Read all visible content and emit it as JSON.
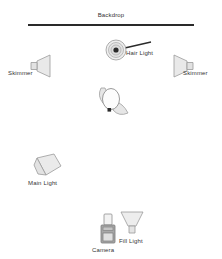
{
  "diagram": {
    "background_color": "#ffffff",
    "stroke_color": "#9a9a9a",
    "fill_color": "#e8e8e8",
    "label_color": "#333333",
    "backdrop": {
      "label": "Backdrop",
      "color": "#2a2a2a",
      "x": 28,
      "y": 24,
      "width": 166
    },
    "elements": [
      {
        "id": "hair-light",
        "label": "Hair Light",
        "icon": "umbrella-top-view-icon",
        "x": 105,
        "y": 39
      },
      {
        "id": "skimmer-left",
        "label": "Skimmer",
        "icon": "softbox-left-icon",
        "x": 30,
        "y": 54
      },
      {
        "id": "skimmer-right",
        "label": "Skimmer",
        "icon": "softbox-right-icon",
        "x": 172,
        "y": 54
      },
      {
        "id": "subject",
        "label": "",
        "icon": "subject-figure-icon",
        "x": 95,
        "y": 86
      },
      {
        "id": "main-light",
        "label": "Main Light",
        "icon": "softbox-angled-icon",
        "x": 33,
        "y": 153
      },
      {
        "id": "camera",
        "label": "Camera",
        "icon": "camera-icon",
        "x": 99,
        "y": 213
      },
      {
        "id": "fill-light",
        "label": "Fill Light",
        "icon": "softbox-down-icon",
        "x": 120,
        "y": 210
      }
    ]
  }
}
